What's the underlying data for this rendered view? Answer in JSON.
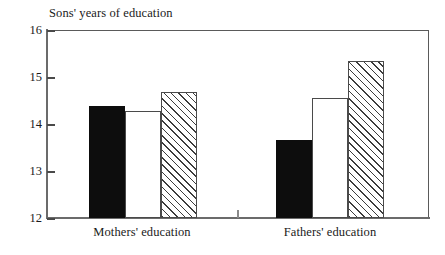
{
  "chart_data": {
    "type": "bar",
    "title": "Sons' years of education",
    "xlabel": "",
    "ylabel": "Sons' years of education",
    "ylim": [
      12,
      16
    ],
    "yticks": [
      12,
      13,
      14,
      15,
      16
    ],
    "ytick_labels": [
      "12",
      "13",
      "14",
      "15",
      "16"
    ],
    "grid": false,
    "legend": "none",
    "categories": [
      "Mothers' education",
      "Fathers' education"
    ],
    "series": [
      {
        "name": "solid",
        "style": "filled-black",
        "values": [
          14.38,
          13.65
        ]
      },
      {
        "name": "open",
        "style": "open-white",
        "values": [
          14.28,
          14.55
        ]
      },
      {
        "name": "hatched",
        "style": "diagonal-hatch",
        "values": [
          14.68,
          15.34
        ]
      }
    ]
  },
  "axis": {
    "y_labels": {
      "t16": "16",
      "t15": "15",
      "t14": "14",
      "t13": "13",
      "t12": "12"
    },
    "x_labels": {
      "group1": "Mothers' education",
      "group2": "Fathers' education"
    }
  },
  "title": "Sons' years of education",
  "colors": {
    "solid_bar": "#0d0d0d",
    "open_bar_fill": "#ffffff",
    "bar_outline": "#4a4a4a",
    "hatch_line": "#3c3c3c",
    "axis": "#6b6b6b",
    "text": "#1a1a1a",
    "background": "#ffffff"
  }
}
